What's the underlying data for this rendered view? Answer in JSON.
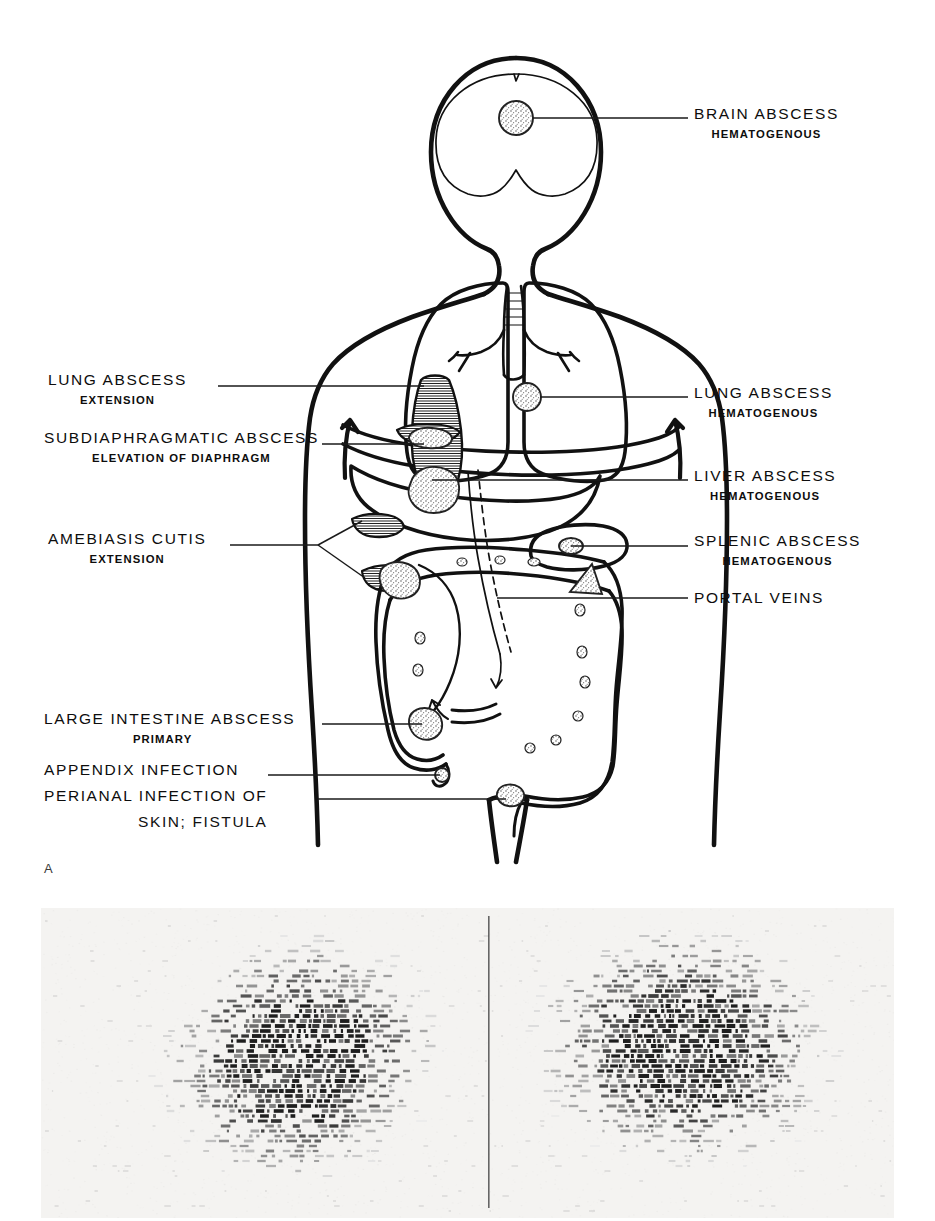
{
  "figure": {
    "panel_letter": "A",
    "type": "medical-illustration-with-scintigram"
  },
  "labels_left": [
    {
      "id": "lung-abscess-extension",
      "main": "LUNG  ABSCESS",
      "sub": "EXTENSION",
      "text_x": 48,
      "text_y": 371,
      "leader": {
        "x1": 218,
        "y1": 386,
        "x2": 424,
        "y2": 386
      }
    },
    {
      "id": "subdiaphragmatic-abscess",
      "main": "SUBDIAPHRAGMATIC   ABSCESS",
      "sub": "ELEVATION  OF  DIAPHRAGM",
      "text_x": 44,
      "text_y": 429,
      "leader": {
        "x1": 322,
        "y1": 444,
        "x2": 424,
        "y2": 444
      }
    },
    {
      "id": "amebiasis-cutis-extension",
      "main": "AMEBIASIS   CUTIS",
      "sub": "EXTENSION",
      "text_x": 48,
      "text_y": 530,
      "leader": {
        "x1": 230,
        "y1": 545,
        "x2": 318,
        "y2": 545
      }
    },
    {
      "id": "large-intestine-abscess",
      "main": "LARGE  INTESTINE  ABSCESS",
      "sub": "PRIMARY",
      "text_x": 44,
      "text_y": 710,
      "leader": {
        "x1": 322,
        "y1": 724,
        "x2": 422,
        "y2": 724
      }
    },
    {
      "id": "appendix-infection",
      "main": "APPENDIX   INFECTION",
      "sub": "",
      "text_x": 44,
      "text_y": 761,
      "leader": {
        "x1": 268,
        "y1": 775,
        "x2": 440,
        "y2": 775
      }
    },
    {
      "id": "perianal-infection",
      "main": "PERIANAL   INFECTION   OF",
      "sub": "",
      "line2": "SKIN;   FISTULA",
      "text_x": 44,
      "text_y": 787,
      "leader": {
        "x1": 318,
        "y1": 799,
        "x2": 506,
        "y2": 799
      }
    }
  ],
  "labels_right": [
    {
      "id": "brain-abscess-hematogenous",
      "main": "BRAIN  ABSCESS",
      "sub": "HEMATOGENOUS",
      "text_x": 694,
      "text_y": 105,
      "leader": {
        "x1": 537,
        "y1": 118,
        "x2": 688,
        "y2": 118
      }
    },
    {
      "id": "lung-abscess-hematogenous",
      "main": "LUNG  ABSCESS",
      "sub": "HEMATOGENOUS",
      "text_x": 694,
      "text_y": 384,
      "leader": {
        "x1": 540,
        "y1": 397,
        "x2": 688,
        "y2": 397
      }
    },
    {
      "id": "liver-abscess-hematogenous",
      "main": "LIVER  ABSCESS",
      "sub": "HEMATOGENOUS",
      "text_x": 694,
      "text_y": 467,
      "leader": {
        "x1": 430,
        "y1": 480,
        "x2": 688,
        "y2": 480
      }
    },
    {
      "id": "splenic-abscess-hematogenous",
      "main": "SPLENIC  ABSCESS",
      "sub": "HEMATOGENOUS",
      "text_x": 694,
      "text_y": 532,
      "leader": {
        "x1": 560,
        "y1": 545,
        "x2": 688,
        "y2": 545
      }
    },
    {
      "id": "portal-veins",
      "main": "PORTAL   VEINS",
      "sub": "",
      "text_x": 694,
      "text_y": 589,
      "leader": {
        "x1": 498,
        "y1": 598,
        "x2": 688,
        "y2": 598
      }
    }
  ],
  "lesions": [
    {
      "id": "brain-abscess-lesion",
      "cx": 516,
      "cy": 118,
      "r": 17,
      "style": "stippled-circle"
    },
    {
      "id": "lung-abscess-lesion-right",
      "cx": 527,
      "cy": 397,
      "r": 14,
      "style": "stippled-circle"
    },
    {
      "id": "liver-abscess-lesion",
      "cx": 430,
      "cy": 489,
      "rx": 26,
      "ry": 22,
      "style": "stippled-blob"
    },
    {
      "id": "subphrenic-abscess-lesion",
      "cx": 430,
      "cy": 437,
      "rx": 22,
      "ry": 9,
      "style": "stippled-blob"
    },
    {
      "id": "splenic-abscess-lesion",
      "cx": 571,
      "cy": 546,
      "rx": 12,
      "ry": 8,
      "style": "stippled-ellipse"
    },
    {
      "id": "portal-vein-marker",
      "cx": 583,
      "cy": 580,
      "style": "stippled-triangle"
    },
    {
      "id": "cutaneous-abscess-lesion",
      "cx": 396,
      "cy": 582,
      "rx": 18,
      "ry": 15,
      "style": "stippled-blob"
    },
    {
      "id": "large-intestine-lesion",
      "cx": 424,
      "cy": 724,
      "rx": 16,
      "ry": 13,
      "style": "stippled-blob"
    },
    {
      "id": "appendix-lesion",
      "cx": 442,
      "cy": 775,
      "r": 7,
      "style": "stippled-circle"
    },
    {
      "id": "perianal-lesion",
      "cx": 510,
      "cy": 797,
      "rx": 12,
      "ry": 9,
      "style": "stippled-blob"
    }
  ],
  "anatomy": [
    {
      "id": "head-outline",
      "label": "head"
    },
    {
      "id": "brain-outline",
      "label": "brain"
    },
    {
      "id": "torso-outline",
      "label": "torso"
    },
    {
      "id": "lung-left",
      "label": "left lung"
    },
    {
      "id": "lung-right",
      "label": "right lung"
    },
    {
      "id": "trachea-bronchi",
      "label": "trachea and bronchi"
    },
    {
      "id": "diaphragm",
      "label": "diaphragm"
    },
    {
      "id": "liver",
      "label": "liver"
    },
    {
      "id": "spleen",
      "label": "spleen"
    },
    {
      "id": "colon",
      "label": "large intestine"
    },
    {
      "id": "appendix",
      "label": "appendix"
    },
    {
      "id": "rectum",
      "label": "rectum"
    },
    {
      "id": "portal-vein",
      "label": "portal vein"
    },
    {
      "id": "extension-tract",
      "label": "hatched extension tract"
    }
  ],
  "scan": {
    "id": "radioisotope-scan",
    "panels": 2,
    "divider_x": 488,
    "description": "paired rectilinear radioisotope scintigram"
  }
}
